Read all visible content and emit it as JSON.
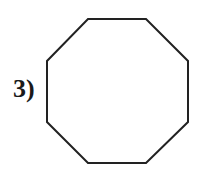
{
  "problem": {
    "number_label": "3)",
    "shape": "octagon",
    "sides": 8,
    "stroke_color": "#222222",
    "fill_color": "#ffffff"
  }
}
